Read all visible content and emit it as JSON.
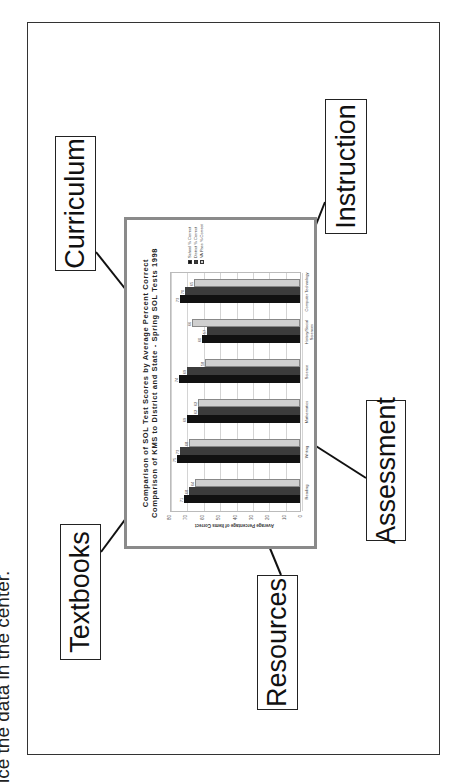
{
  "caption": "ice the data in the center.",
  "labels": {
    "curriculum": "Curriculum",
    "instruction": "Instruction",
    "textbooks": "Textbooks",
    "resources": "Resources",
    "assessment": "Assessment"
  },
  "colors": {
    "school": "#111111",
    "district": "#3c3c3c",
    "state": "#cfcfcf",
    "chart_border": "#8a8a8a"
  },
  "chart_data": {
    "type": "bar",
    "title": "Comparison of SOL Test Scores by Average Percent Correct",
    "subtitle": "Comparison of KMS to District and State - Spring SOL Tests 1998",
    "xlabel": "",
    "ylabel": "Average Percentage of Items Correct",
    "ylim": [
      0,
      80
    ],
    "yticks": [
      0,
      10,
      20,
      30,
      40,
      50,
      60,
      70,
      80
    ],
    "grid": true,
    "legend_position": "right",
    "categories": [
      "Reading",
      "Writing",
      "Mathematics",
      "Science",
      "History/Social Sciences",
      "Computer Technology"
    ],
    "series": [
      {
        "name": "School % Correct",
        "values": [
          71,
          75,
          69,
          74,
          60,
          73
        ]
      },
      {
        "name": "District % Correct",
        "values": [
          68,
          73,
          62,
          69,
          57,
          70
        ]
      },
      {
        "name": "VA Pass % Correct",
        "values": [
          64,
          68,
          62,
          58,
          66,
          65
        ]
      }
    ]
  }
}
